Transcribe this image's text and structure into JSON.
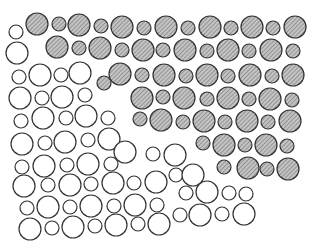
{
  "figure": {
    "title_fragment": "",
    "width": 317,
    "height": 252,
    "stroke_color": "#333333",
    "hatch_fill": "#bdbdbd",
    "hatch_line": "#555555",
    "outline_fill": "#ffffff",
    "legend": {
      "hatched": "hatched circle",
      "outline": "outline circle"
    }
  },
  "circles": [
    {
      "x": 16,
      "y": 32,
      "r": 7,
      "t": "o"
    },
    {
      "x": 37,
      "y": 24,
      "r": 11,
      "t": "h"
    },
    {
      "x": 59,
      "y": 24,
      "r": 7,
      "t": "h"
    },
    {
      "x": 79,
      "y": 25,
      "r": 11,
      "t": "h"
    },
    {
      "x": 101,
      "y": 26,
      "r": 7,
      "t": "h"
    },
    {
      "x": 122,
      "y": 27,
      "r": 11,
      "t": "h"
    },
    {
      "x": 144,
      "y": 28,
      "r": 7,
      "t": "h"
    },
    {
      "x": 166,
      "y": 27,
      "r": 11,
      "t": "h"
    },
    {
      "x": 188,
      "y": 28,
      "r": 7,
      "t": "h"
    },
    {
      "x": 210,
      "y": 27,
      "r": 11,
      "t": "h"
    },
    {
      "x": 231,
      "y": 28,
      "r": 7,
      "t": "h"
    },
    {
      "x": 252,
      "y": 27,
      "r": 11,
      "t": "h"
    },
    {
      "x": 273,
      "y": 28,
      "r": 7,
      "t": "h"
    },
    {
      "x": 295,
      "y": 27,
      "r": 11,
      "t": "h"
    },
    {
      "x": 17,
      "y": 53,
      "r": 11,
      "t": "o"
    },
    {
      "x": 57,
      "y": 47,
      "r": 11,
      "t": "h"
    },
    {
      "x": 79,
      "y": 48,
      "r": 7,
      "t": "h"
    },
    {
      "x": 100,
      "y": 48,
      "r": 11,
      "t": "h"
    },
    {
      "x": 122,
      "y": 50,
      "r": 7,
      "t": "h"
    },
    {
      "x": 143,
      "y": 50,
      "r": 11,
      "t": "h"
    },
    {
      "x": 163,
      "y": 50,
      "r": 7,
      "t": "h"
    },
    {
      "x": 185,
      "y": 50,
      "r": 11,
      "t": "h"
    },
    {
      "x": 207,
      "y": 51,
      "r": 7,
      "t": "h"
    },
    {
      "x": 228,
      "y": 50,
      "r": 11,
      "t": "h"
    },
    {
      "x": 249,
      "y": 51,
      "r": 7,
      "t": "h"
    },
    {
      "x": 271,
      "y": 50,
      "r": 11,
      "t": "h"
    },
    {
      "x": 293,
      "y": 51,
      "r": 7,
      "t": "h"
    },
    {
      "x": 19,
      "y": 77,
      "r": 7,
      "t": "o"
    },
    {
      "x": 40,
      "y": 75,
      "r": 11,
      "t": "o"
    },
    {
      "x": 61,
      "y": 75,
      "r": 7,
      "t": "o"
    },
    {
      "x": 80,
      "y": 73,
      "r": 11,
      "t": "o"
    },
    {
      "x": 104,
      "y": 83,
      "r": 7,
      "t": "h"
    },
    {
      "x": 120,
      "y": 74,
      "r": 11,
      "t": "h"
    },
    {
      "x": 142,
      "y": 75,
      "r": 7,
      "t": "h"
    },
    {
      "x": 164,
      "y": 75,
      "r": 11,
      "t": "h"
    },
    {
      "x": 186,
      "y": 76,
      "r": 7,
      "t": "h"
    },
    {
      "x": 207,
      "y": 75,
      "r": 11,
      "t": "h"
    },
    {
      "x": 228,
      "y": 76,
      "r": 7,
      "t": "h"
    },
    {
      "x": 250,
      "y": 75,
      "r": 11,
      "t": "h"
    },
    {
      "x": 272,
      "y": 76,
      "r": 7,
      "t": "h"
    },
    {
      "x": 293,
      "y": 75,
      "r": 11,
      "t": "h"
    },
    {
      "x": 20,
      "y": 98,
      "r": 11,
      "t": "o"
    },
    {
      "x": 42,
      "y": 98,
      "r": 7,
      "t": "o"
    },
    {
      "x": 62,
      "y": 97,
      "r": 11,
      "t": "o"
    },
    {
      "x": 85,
      "y": 95,
      "r": 7,
      "t": "o"
    },
    {
      "x": 142,
      "y": 98,
      "r": 11,
      "t": "h"
    },
    {
      "x": 163,
      "y": 97,
      "r": 7,
      "t": "h"
    },
    {
      "x": 184,
      "y": 98,
      "r": 11,
      "t": "h"
    },
    {
      "x": 207,
      "y": 99,
      "r": 7,
      "t": "h"
    },
    {
      "x": 228,
      "y": 98,
      "r": 11,
      "t": "h"
    },
    {
      "x": 249,
      "y": 99,
      "r": 7,
      "t": "h"
    },
    {
      "x": 270,
      "y": 99,
      "r": 11,
      "t": "h"
    },
    {
      "x": 292,
      "y": 100,
      "r": 7,
      "t": "h"
    },
    {
      "x": 21,
      "y": 121,
      "r": 7,
      "t": "o"
    },
    {
      "x": 43,
      "y": 118,
      "r": 11,
      "t": "o"
    },
    {
      "x": 66,
      "y": 118,
      "r": 7,
      "t": "o"
    },
    {
      "x": 86,
      "y": 116,
      "r": 11,
      "t": "o"
    },
    {
      "x": 108,
      "y": 118,
      "r": 7,
      "t": "o"
    },
    {
      "x": 140,
      "y": 119,
      "r": 7,
      "t": "h"
    },
    {
      "x": 161,
      "y": 120,
      "r": 11,
      "t": "h"
    },
    {
      "x": 183,
      "y": 122,
      "r": 7,
      "t": "h"
    },
    {
      "x": 204,
      "y": 121,
      "r": 11,
      "t": "h"
    },
    {
      "x": 225,
      "y": 122,
      "r": 7,
      "t": "h"
    },
    {
      "x": 247,
      "y": 121,
      "r": 11,
      "t": "h"
    },
    {
      "x": 268,
      "y": 122,
      "r": 7,
      "t": "h"
    },
    {
      "x": 290,
      "y": 121,
      "r": 11,
      "t": "h"
    },
    {
      "x": 22,
      "y": 144,
      "r": 11,
      "t": "o"
    },
    {
      "x": 45,
      "y": 143,
      "r": 7,
      "t": "o"
    },
    {
      "x": 65,
      "y": 142,
      "r": 11,
      "t": "o"
    },
    {
      "x": 88,
      "y": 140,
      "r": 7,
      "t": "o"
    },
    {
      "x": 109,
      "y": 139,
      "r": 11,
      "t": "o"
    },
    {
      "x": 203,
      "y": 143,
      "r": 7,
      "t": "h"
    },
    {
      "x": 224,
      "y": 145,
      "r": 11,
      "t": "h"
    },
    {
      "x": 245,
      "y": 145,
      "r": 7,
      "t": "h"
    },
    {
      "x": 266,
      "y": 145,
      "r": 11,
      "t": "h"
    },
    {
      "x": 287,
      "y": 146,
      "r": 7,
      "t": "h"
    },
    {
      "x": 22,
      "y": 167,
      "r": 7,
      "t": "o"
    },
    {
      "x": 44,
      "y": 166,
      "r": 11,
      "t": "o"
    },
    {
      "x": 67,
      "y": 165,
      "r": 7,
      "t": "o"
    },
    {
      "x": 88,
      "y": 164,
      "r": 11,
      "t": "o"
    },
    {
      "x": 111,
      "y": 164,
      "r": 7,
      "t": "o"
    },
    {
      "x": 125,
      "y": 152,
      "r": 11,
      "t": "o"
    },
    {
      "x": 153,
      "y": 154,
      "r": 7,
      "t": "o"
    },
    {
      "x": 175,
      "y": 155,
      "r": 11,
      "t": "o"
    },
    {
      "x": 224,
      "y": 167,
      "r": 7,
      "t": "h"
    },
    {
      "x": 248,
      "y": 168,
      "r": 11,
      "t": "h"
    },
    {
      "x": 267,
      "y": 169,
      "r": 7,
      "t": "h"
    },
    {
      "x": 288,
      "y": 169,
      "r": 11,
      "t": "h"
    },
    {
      "x": 24,
      "y": 186,
      "r": 11,
      "t": "o"
    },
    {
      "x": 48,
      "y": 185,
      "r": 7,
      "t": "o"
    },
    {
      "x": 70,
      "y": 185,
      "r": 11,
      "t": "o"
    },
    {
      "x": 91,
      "y": 184,
      "r": 7,
      "t": "o"
    },
    {
      "x": 113,
      "y": 183,
      "r": 11,
      "t": "o"
    },
    {
      "x": 134,
      "y": 183,
      "r": 7,
      "t": "o"
    },
    {
      "x": 156,
      "y": 182,
      "r": 11,
      "t": "o"
    },
    {
      "x": 176,
      "y": 175,
      "r": 7,
      "t": "o"
    },
    {
      "x": 193,
      "y": 175,
      "r": 11,
      "t": "o"
    },
    {
      "x": 27,
      "y": 208,
      "r": 7,
      "t": "o"
    },
    {
      "x": 48,
      "y": 207,
      "r": 11,
      "t": "o"
    },
    {
      "x": 70,
      "y": 207,
      "r": 7,
      "t": "o"
    },
    {
      "x": 91,
      "y": 206,
      "r": 11,
      "t": "o"
    },
    {
      "x": 114,
      "y": 206,
      "r": 7,
      "t": "o"
    },
    {
      "x": 135,
      "y": 205,
      "r": 11,
      "t": "o"
    },
    {
      "x": 157,
      "y": 205,
      "r": 7,
      "t": "o"
    },
    {
      "x": 186,
      "y": 193,
      "r": 7,
      "t": "o"
    },
    {
      "x": 207,
      "y": 192,
      "r": 11,
      "t": "o"
    },
    {
      "x": 229,
      "y": 193,
      "r": 7,
      "t": "o"
    },
    {
      "x": 246,
      "y": 194,
      "r": 7,
      "t": "o"
    },
    {
      "x": 30,
      "y": 229,
      "r": 11,
      "t": "o"
    },
    {
      "x": 52,
      "y": 228,
      "r": 7,
      "t": "o"
    },
    {
      "x": 73,
      "y": 227,
      "r": 11,
      "t": "o"
    },
    {
      "x": 95,
      "y": 226,
      "r": 7,
      "t": "o"
    },
    {
      "x": 116,
      "y": 225,
      "r": 11,
      "t": "o"
    },
    {
      "x": 138,
      "y": 224,
      "r": 7,
      "t": "o"
    },
    {
      "x": 159,
      "y": 224,
      "r": 11,
      "t": "o"
    },
    {
      "x": 180,
      "y": 215,
      "r": 7,
      "t": "o"
    },
    {
      "x": 200,
      "y": 215,
      "r": 11,
      "t": "o"
    },
    {
      "x": 222,
      "y": 214,
      "r": 7,
      "t": "o"
    },
    {
      "x": 244,
      "y": 214,
      "r": 11,
      "t": "o"
    }
  ]
}
